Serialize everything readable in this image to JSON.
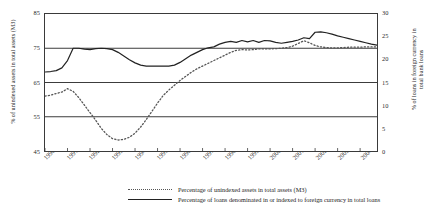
{
  "chart_data": {
    "type": "line",
    "title": "",
    "xlabel": "",
    "grid": "horizontal",
    "legend_position": "bottom",
    "x_axis": {
      "tick_labels": [
        "1990",
        "1991",
        "1992",
        "1993",
        "1994",
        "1995",
        "1996",
        "1997",
        "1998",
        "1999",
        "2000",
        "2001",
        "2002",
        "2003",
        "2004"
      ],
      "range": [
        1990,
        2004.75
      ]
    },
    "y_axis_left": {
      "label": "% of unindexed assets in total assets (M3)",
      "ticks": [
        45,
        55,
        65,
        75,
        85
      ],
      "range": [
        45,
        85
      ]
    },
    "y_axis_right": {
      "label_line_1": "% of loans in foreign currency in",
      "label_line_2": "total bank loans",
      "ticks": [
        0,
        5,
        10,
        15,
        20,
        25,
        30
      ],
      "range": [
        0,
        30
      ]
    },
    "series": [
      {
        "name": "Percentage of unindexed assets in total assets (M3)",
        "axis": "left",
        "style": "dotted",
        "color": "#555555",
        "x": [
          1990.0,
          1990.25,
          1990.5,
          1990.75,
          1991.0,
          1991.25,
          1991.5,
          1991.75,
          1992.0,
          1992.25,
          1992.5,
          1992.75,
          1993.0,
          1993.25,
          1993.5,
          1993.75,
          1994.0,
          1994.25,
          1994.5,
          1994.75,
          1995.0,
          1995.25,
          1995.5,
          1995.75,
          1996.0,
          1996.25,
          1996.5,
          1996.75,
          1997.0,
          1997.25,
          1997.5,
          1997.75,
          1998.0,
          1998.25,
          1998.5,
          1998.75,
          1999.0,
          1999.25,
          1999.5,
          1999.75,
          2000.0,
          2000.25,
          2000.5,
          2000.75,
          2001.0,
          2001.25,
          2001.5,
          2001.75,
          2002.0,
          2002.25,
          2002.5,
          2002.75,
          2003.0,
          2003.25,
          2003.5,
          2003.75,
          2004.0,
          2004.25,
          2004.5,
          2004.75
        ],
        "y": [
          61.0,
          61.3,
          61.8,
          62.2,
          63.2,
          62.4,
          60.6,
          58.4,
          56.2,
          54.0,
          51.6,
          49.8,
          48.6,
          48.2,
          48.4,
          49.0,
          50.2,
          52.0,
          54.2,
          56.6,
          59.0,
          61.2,
          62.8,
          64.2,
          65.6,
          66.8,
          68.0,
          69.0,
          69.8,
          70.6,
          71.4,
          72.2,
          73.0,
          73.8,
          74.4,
          74.6,
          74.5,
          74.6,
          74.8,
          74.8,
          74.8,
          74.9,
          75.0,
          75.2,
          75.6,
          76.4,
          77.2,
          76.6,
          75.8,
          75.4,
          75.2,
          75.1,
          75.1,
          75.2,
          75.3,
          75.3,
          75.3,
          75.4,
          75.4,
          75.4
        ]
      },
      {
        "name": "Percentage of loans denominated in or indexed to foreign currency in total loans",
        "axis": "right",
        "style": "solid",
        "color": "#222222",
        "x": [
          1990.0,
          1990.25,
          1990.5,
          1990.75,
          1991.0,
          1991.25,
          1991.5,
          1991.75,
          1992.0,
          1992.25,
          1992.5,
          1992.75,
          1993.0,
          1993.25,
          1993.5,
          1993.75,
          1994.0,
          1994.25,
          1994.5,
          1994.75,
          1995.0,
          1995.25,
          1995.5,
          1995.75,
          1996.0,
          1996.25,
          1996.5,
          1996.75,
          1997.0,
          1997.25,
          1997.5,
          1997.75,
          1998.0,
          1998.25,
          1998.5,
          1998.75,
          1999.0,
          1999.25,
          1999.5,
          1999.75,
          2000.0,
          2000.25,
          2000.5,
          2000.75,
          2001.0,
          2001.25,
          2001.5,
          2001.75,
          2002.0,
          2002.25,
          2002.5,
          2002.75,
          2003.0,
          2003.25,
          2003.5,
          2003.75,
          2004.0,
          2004.25,
          2004.5,
          2004.75
        ],
        "y": [
          17.3,
          17.4,
          17.6,
          18.2,
          19.8,
          22.5,
          22.5,
          22.3,
          22.2,
          22.4,
          22.5,
          22.4,
          22.2,
          21.6,
          20.8,
          20.0,
          19.3,
          18.8,
          18.6,
          18.6,
          18.6,
          18.6,
          18.6,
          18.8,
          19.4,
          20.2,
          21.0,
          21.6,
          22.2,
          22.6,
          22.8,
          23.4,
          23.8,
          24.0,
          23.8,
          24.2,
          23.9,
          24.2,
          23.8,
          24.2,
          24.1,
          23.8,
          23.6,
          23.8,
          24.0,
          24.3,
          24.8,
          24.6,
          26.0,
          26.1,
          25.9,
          25.6,
          25.2,
          24.9,
          24.6,
          24.3,
          24.0,
          23.7,
          23.4,
          23.2
        ]
      }
    ],
    "legend": [
      {
        "label": "Percentage of unindexed assets in total assets (M3)",
        "style": "dotted"
      },
      {
        "label": "Percentage of loans denominated in or indexed to foreign currency in total loans",
        "style": "solid"
      }
    ]
  }
}
